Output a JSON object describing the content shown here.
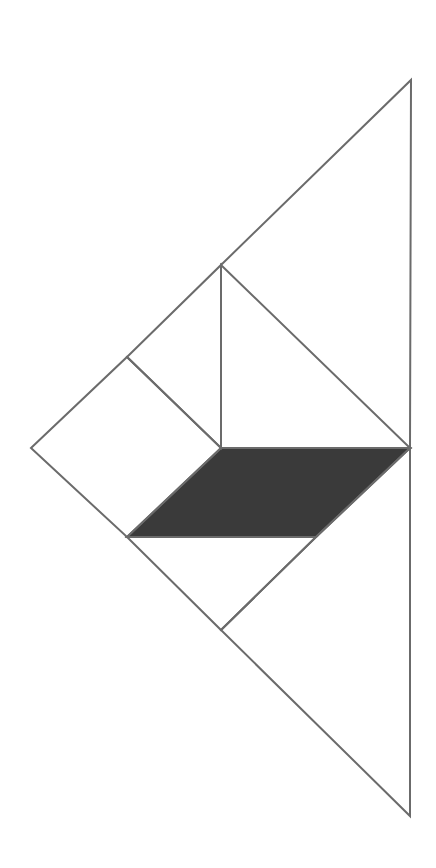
{
  "diagram": {
    "type": "tangram",
    "stroke_color": "#6b6b6b",
    "fill_shaded": "#3a3a3a",
    "fill_plain": "#ffffff",
    "pieces": [
      {
        "name": "large-triangle-top",
        "points": "221,265 411,80 410,448 221,448",
        "shaded": false
      },
      {
        "name": "medium-triangle-inner",
        "points": "221,265 410,448 221,448",
        "shaded": false
      },
      {
        "name": "small-triangle-upper",
        "points": "127,357 221,265 221,448",
        "shaded": false
      },
      {
        "name": "square",
        "points": "31,448 127,357 221,448 127,537",
        "shaded": false
      },
      {
        "name": "parallelogram",
        "points": "221,448 410,448 316,537 127,537",
        "shaded": true
      },
      {
        "name": "small-triangle-lower",
        "points": "127,537 316,537 221,630",
        "shaded": false
      },
      {
        "name": "large-triangle-bottom",
        "points": "221,630 316,537 410,448 410,816",
        "shaded": false
      }
    ]
  }
}
